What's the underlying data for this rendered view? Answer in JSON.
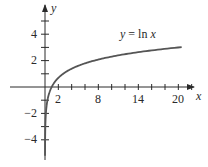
{
  "chart_data": {
    "type": "line",
    "title": "",
    "xlabel": "x",
    "ylabel": "y",
    "xlim": [
      -1.5,
      22.5
    ],
    "ylim": [
      -5.2,
      6.4
    ],
    "grid": false,
    "x_ticks": {
      "minor_every": 2,
      "labeled": [
        2,
        8,
        14,
        20
      ],
      "labels": [
        "2",
        "8",
        "14",
        "20"
      ]
    },
    "y_ticks": {
      "minor_every": 1,
      "labeled": [
        -4,
        -2,
        2,
        4
      ],
      "labels": [
        "−4",
        "−2",
        "2",
        "4"
      ]
    },
    "series": [
      {
        "name": "y = ln x",
        "function": "ln(x)",
        "x": [
          0.005,
          0.02,
          0.05,
          0.1,
          0.2,
          0.5,
          1,
          2,
          3,
          4,
          6,
          8,
          10,
          12,
          14,
          16,
          18,
          20
        ],
        "values": [
          -5.3,
          -3.91,
          -3.0,
          -2.3,
          -1.61,
          -0.69,
          0.0,
          0.69,
          1.1,
          1.39,
          1.79,
          2.08,
          2.3,
          2.48,
          2.64,
          2.77,
          2.89,
          3.0
        ]
      }
    ],
    "annotations": [
      {
        "text_prefix": "y",
        "text_eq": " = ln ",
        "text_var": "x",
        "near_x": 13,
        "near_y": 3.6
      }
    ],
    "colors": {
      "axis": "#2a2a2a",
      "curve": "#555555"
    }
  },
  "labels": {
    "x_axis": "x",
    "y_axis": "y",
    "curve_y": "y",
    "curve_eq": " = ln ",
    "curve_x": "x",
    "x_ticks": [
      "2",
      "8",
      "14",
      "20"
    ],
    "y_ticks_pos": [
      "4",
      "2"
    ],
    "y_ticks_neg": [
      "−2",
      "−4"
    ]
  }
}
